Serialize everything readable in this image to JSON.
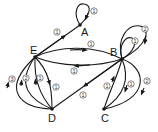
{
  "diagram": {
    "type": "directed-multigraph",
    "nodes": [
      {
        "id": "A",
        "label": "A"
      },
      {
        "id": "B",
        "label": "B"
      },
      {
        "id": "C",
        "label": "C"
      },
      {
        "id": "D",
        "label": "D"
      },
      {
        "id": "E",
        "label": "E"
      }
    ],
    "edges": [
      {
        "from": "E",
        "to": "A",
        "weight": "1"
      },
      {
        "from": "A",
        "to": "A",
        "weight": "1"
      },
      {
        "from": "B",
        "to": "B",
        "weight": "1"
      },
      {
        "from": "B",
        "to": "B",
        "weight": "2"
      },
      {
        "from": "E",
        "to": "B",
        "weight": "1"
      },
      {
        "from": "B",
        "to": "E",
        "weight": "1"
      },
      {
        "from": "B",
        "to": "D",
        "weight": "1"
      },
      {
        "from": "D",
        "to": "E",
        "weight": "3"
      },
      {
        "from": "D",
        "to": "E",
        "weight": "2"
      },
      {
        "from": "D",
        "to": "E",
        "weight": "1"
      },
      {
        "from": "E",
        "to": "D",
        "weight": "1"
      },
      {
        "from": "C",
        "to": "B",
        "weight": "1"
      },
      {
        "from": "B",
        "to": "C",
        "weight": "1"
      },
      {
        "from": "B",
        "to": "C",
        "weight": "2"
      }
    ]
  }
}
